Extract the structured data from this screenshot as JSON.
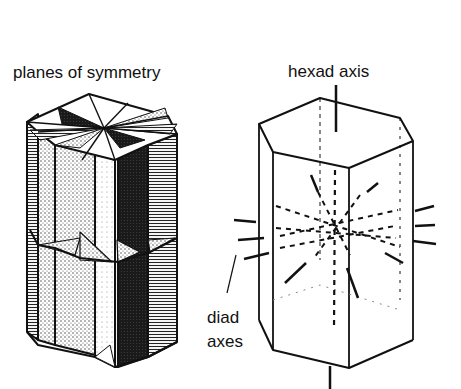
{
  "figure": {
    "left_panel": {
      "title": "planes of symmetry",
      "subject": "hexagonal prism with six planes of symmetry shown as shaded sections"
    },
    "right_panel": {
      "labels": {
        "hexad_axis": "hexad axis",
        "diad_axes_line1": "diad",
        "diad_axes_line2": "axes"
      },
      "subject": "hexagonal prism showing one vertical hexad axis and six horizontal diad axes"
    },
    "colors": {
      "ink": "#111111",
      "background": "#ffffff",
      "dark_fill": "#1a1a1a",
      "stipple_fill": "#d8d8d8",
      "light_fill": "#f2f2f2"
    }
  }
}
